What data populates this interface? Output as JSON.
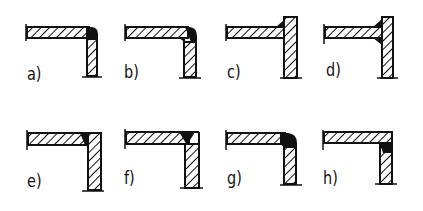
{
  "colors": {
    "ink": "#111111",
    "background": "#ffffff"
  },
  "figures": [
    {
      "id": "a",
      "label": "a)",
      "joint": "horizontal plate over vertical plate, rounded outer corner fillet weld"
    },
    {
      "id": "b",
      "label": "b)",
      "joint": "bent/rounded corner with inner and outer weld"
    },
    {
      "id": "c",
      "label": "c)",
      "joint": "horizontal plate butting vertical plate, single fillet on top"
    },
    {
      "id": "d",
      "label": "d)",
      "joint": "horizontal plate butting vertical plate, double fillet top and bottom"
    },
    {
      "id": "e",
      "label": "e)",
      "joint": "flush corner, weld in inner groove at top"
    },
    {
      "id": "f",
      "label": "f)",
      "joint": "flush corner, V-groove weld at top"
    },
    {
      "id": "g",
      "label": "g)",
      "joint": "rounded corner, full penetration weld"
    },
    {
      "id": "h",
      "label": "h)",
      "joint": "flush corner, inner fillet weld below horizontal plate"
    }
  ]
}
